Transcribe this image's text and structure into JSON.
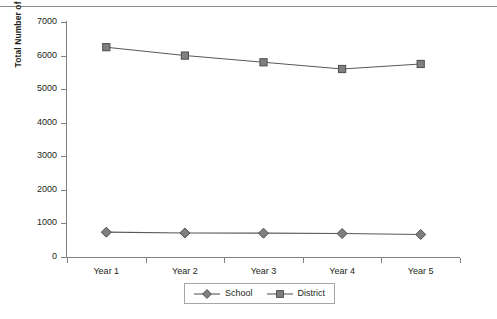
{
  "chart_data": {
    "type": "line",
    "title": "",
    "xlabel": "",
    "ylabel": "Total Number of Students Enrolled",
    "categories": [
      "Year 1",
      "Year 2",
      "Year 3",
      "Year 4",
      "Year 5"
    ],
    "ylim": [
      0,
      7000
    ],
    "ytick_labels": [
      "0",
      "1000",
      "2000",
      "3000",
      "4000",
      "5000",
      "6000",
      "7000"
    ],
    "ytick_values": [
      0,
      1000,
      2000,
      3000,
      4000,
      5000,
      6000,
      7000
    ],
    "grid": false,
    "legend_position": "bottom-center",
    "series": [
      {
        "name": "School",
        "marker": "diamond",
        "color": "#7f7f7f",
        "line_color": "#595959",
        "values": [
          740,
          715,
          710,
          700,
          670
        ]
      },
      {
        "name": "District",
        "marker": "square",
        "color": "#808080",
        "line_color": "#595959",
        "values": [
          6250,
          6000,
          5800,
          5600,
          5750
        ]
      }
    ]
  },
  "legend": {
    "entries": [
      {
        "label": "School"
      },
      {
        "label": "District"
      }
    ]
  },
  "colors": {
    "axis": "#808080",
    "text": "#231f20",
    "marker_fill": "#808080",
    "marker_stroke": "#4d4d4d",
    "line": "#595959",
    "rule": "#8d8d8d",
    "legend_border": "#a6a6a6"
  }
}
